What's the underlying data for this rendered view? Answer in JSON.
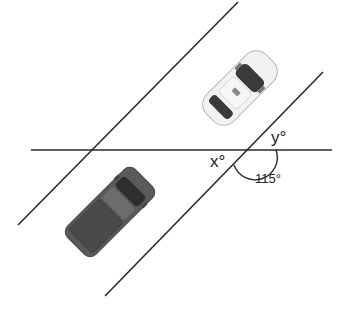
{
  "diagram": {
    "type": "geometry-parallel-lines-transversal",
    "labels": {
      "x": "x°",
      "y": "y°",
      "given_angle": "115°"
    },
    "colors": {
      "line": "#2a2a2a",
      "white_car_body": "#f2f2f2",
      "white_car_glass": "#3a3a3a",
      "dark_car_body": "#5a5a5a",
      "dark_car_glass": "#2e2e2e",
      "background": "#ffffff"
    },
    "objects": [
      "white-car",
      "dark-pickup-truck"
    ]
  }
}
